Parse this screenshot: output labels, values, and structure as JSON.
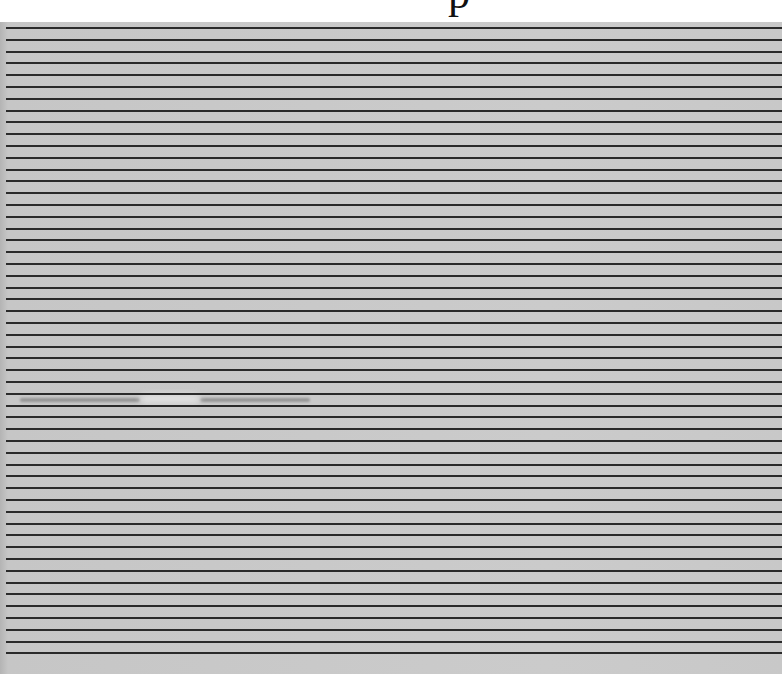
{
  "image": {
    "subject": "lined paper",
    "header_fragment": "p",
    "rules": {
      "count": 54,
      "first_y": 27,
      "spacing_px": 11.8,
      "color": "#2a2a2a"
    },
    "paper_color": "#c9c9c9",
    "background_color": "#ffffff"
  }
}
